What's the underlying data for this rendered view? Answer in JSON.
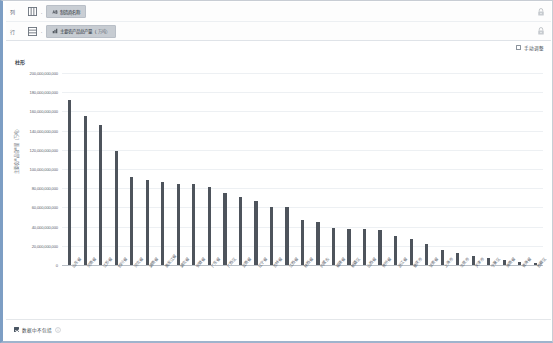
{
  "shelves": {
    "rows": [
      {
        "label": "列",
        "icon": "columns-shelf-icon",
        "separator": ".",
        "pill": {
          "text": "制造商名称",
          "icon": "abc-text-icon",
          "type": "dimension",
          "sub": ""
        },
        "lock": "lock-icon"
      },
      {
        "label": "行",
        "icon": "rows-shelf-icon",
        "separator": ".",
        "pill": {
          "text": "主要农产品总产量（",
          "icon": "measure-icon",
          "type": "measure",
          "sub": "万吨）"
        },
        "lock": "lock-icon"
      }
    ]
  },
  "options": {
    "transpose_label": "手动调整",
    "transpose_checked": false
  },
  "footer": {
    "label": "数据中不包括",
    "checked": true,
    "info_icon": "info-icon"
  },
  "chart_data": {
    "type": "bar",
    "title": "柱形",
    "xlabel": "",
    "ylabel": "主要农产品总产量（万吨）",
    "ylim": [
      0,
      200000000000
    ],
    "grid": true,
    "legend": "none",
    "bar_color": "#4e545c",
    "ytick_labels": [
      "200,000,000,000",
      "180,000,000,000",
      "160,000,000,000",
      "140,000,000,000",
      "120,000,000,000",
      "100,000,000,000",
      "80,000,000,000",
      "60,000,000,000",
      "40,000,000,000",
      "20,000,000,000",
      "0"
    ],
    "ytick_values": [
      200000000000,
      180000000000,
      160000000000,
      140000000000,
      120000000000,
      100000000000,
      80000000000,
      60000000000,
      40000000000,
      20000000000,
      0
    ],
    "categories": [
      "山东省",
      "河南省",
      "江苏省",
      "四川省",
      "河北省",
      "湖南省",
      "黑龙江省",
      "湖北省",
      "安徽省",
      "广东省",
      "广西区",
      "云南省",
      "辽宁省",
      "吉林省",
      "江西省",
      "陕西省",
      "内蒙古",
      "福建省",
      "新疆区",
      "山西省",
      "贵州省",
      "浙江省",
      "重庆市",
      "甘肃省",
      "上海市",
      "北京市",
      "天津市",
      "宁夏区",
      "海南省",
      "青海省",
      "西藏区"
    ],
    "values": [
      172000000000,
      155000000000,
      146000000000,
      119000000000,
      92000000000,
      89000000000,
      86000000000,
      84000000000,
      84000000000,
      81000000000,
      75000000000,
      71000000000,
      67000000000,
      60000000000,
      60000000000,
      47000000000,
      45000000000,
      39000000000,
      38000000000,
      38000000000,
      36000000000,
      30000000000,
      27000000000,
      22000000000,
      16000000000,
      12000000000,
      9000000000,
      7000000000,
      5000000000,
      3000000000,
      2000000000
    ]
  }
}
